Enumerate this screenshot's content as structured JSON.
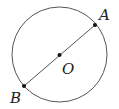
{
  "diagram": {
    "type": "circle-with-diameter",
    "circle": {
      "cx": 59.5,
      "cy": 54.5,
      "r": 47.5,
      "stroke": "#555555"
    },
    "diameter": {
      "stroke": "#555555"
    },
    "points": {
      "A": {
        "label": "A",
        "x": 95,
        "y": 25
      },
      "B": {
        "label": "B",
        "x": 24,
        "y": 86
      },
      "O": {
        "label": "O",
        "x": 59.5,
        "y": 55
      }
    },
    "labels": {
      "A": "A",
      "B": "B",
      "O": "O"
    }
  }
}
